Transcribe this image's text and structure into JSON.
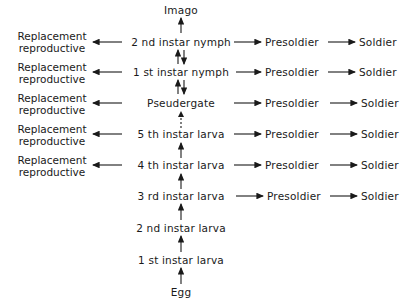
{
  "diagram": {
    "top": "Imago",
    "bottom": "Egg",
    "stages": [
      {
        "label": "2 nd instar nymph",
        "left": [
          "Replacement",
          "reproductive"
        ],
        "right1": "Presoldier",
        "right2": "Soldier"
      },
      {
        "label": "1 st instar nymph",
        "left": [
          "Replacement",
          "reproductive"
        ],
        "right1": "Presoldier",
        "right2": "Soldier"
      },
      {
        "label": "Pseudergate",
        "left": [
          "Replacement",
          "reproductive"
        ],
        "right1": "Presoldier",
        "right2": "Soldier"
      },
      {
        "label": "5 th instar larva",
        "left": [
          "Replacement",
          "reproductive"
        ],
        "right1": "Presoldier",
        "right2": "Soldier"
      },
      {
        "label": "4 th instar larva",
        "left": [
          "Replacement",
          "reproductive"
        ],
        "right1": "Presoldier",
        "right2": "Soldier"
      },
      {
        "label": "3 rd instar larva",
        "right1": "Presoldier",
        "right2": "Soldier"
      },
      {
        "label": "2 nd instar larva"
      },
      {
        "label": "1 st instar larva"
      }
    ],
    "line_color": "#1a1a1a"
  }
}
